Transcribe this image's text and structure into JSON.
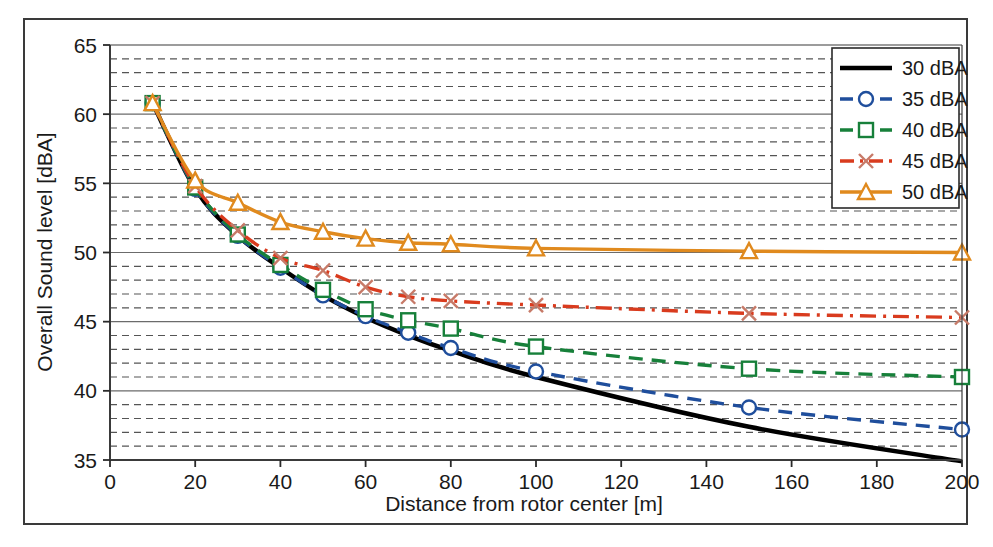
{
  "chart_data": {
    "type": "line",
    "title": "",
    "xlabel": "Distance from rotor center [m]",
    "ylabel": "Overall Sound level [dBA]",
    "xlim": [
      0,
      200
    ],
    "ylim": [
      35,
      65
    ],
    "xticks": [
      0,
      20,
      40,
      60,
      80,
      100,
      120,
      140,
      160,
      180,
      200
    ],
    "yticks": [
      35,
      40,
      45,
      50,
      55,
      60,
      65
    ],
    "grid": "major solid horizontal, minor dashed horizontal every 1 dBA",
    "legend_position": "top-right inside plot",
    "series": [
      {
        "name": "30 dBA",
        "color": "#000000",
        "style": "solid",
        "marker": "none",
        "x": [
          10,
          20,
          30,
          40,
          50,
          60,
          70,
          80,
          100,
          150,
          200
        ],
        "y": [
          60.8,
          54.6,
          51.2,
          48.9,
          46.9,
          45.3,
          44.0,
          42.9,
          41.0,
          37.4,
          34.9
        ]
      },
      {
        "name": "35 dBA",
        "color": "#1F4E9C",
        "style": "dashed",
        "marker": "circle",
        "x": [
          10,
          20,
          30,
          40,
          50,
          60,
          70,
          80,
          100,
          150,
          200
        ],
        "y": [
          60.8,
          54.6,
          51.2,
          48.9,
          46.9,
          45.4,
          44.2,
          43.1,
          41.4,
          38.8,
          37.2
        ]
      },
      {
        "name": "40 dBA",
        "color": "#17803A",
        "style": "dashed",
        "marker": "square",
        "x": [
          10,
          20,
          30,
          40,
          50,
          60,
          70,
          80,
          100,
          150,
          200
        ],
        "y": [
          60.8,
          54.7,
          51.3,
          49.1,
          47.3,
          45.9,
          45.1,
          44.5,
          43.2,
          41.6,
          41.0
        ]
      },
      {
        "name": "45 dBA",
        "color": "#D93B1E",
        "style": "dash-dot",
        "marker": "x",
        "x": [
          10,
          20,
          30,
          40,
          50,
          60,
          70,
          80,
          100,
          150,
          200
        ],
        "y": [
          60.8,
          54.8,
          51.6,
          49.6,
          48.7,
          47.5,
          46.8,
          46.5,
          46.2,
          45.6,
          45.3
        ]
      },
      {
        "name": "50 dBA",
        "color": "#E08A1E",
        "style": "solid",
        "marker": "triangle",
        "x": [
          10,
          20,
          30,
          40,
          50,
          60,
          70,
          80,
          100,
          150,
          200
        ],
        "y": [
          60.8,
          55.2,
          53.6,
          52.2,
          51.5,
          51.0,
          50.7,
          50.6,
          50.3,
          50.1,
          50.0
        ]
      }
    ]
  },
  "legend": {
    "items": [
      {
        "label": "30 dBA"
      },
      {
        "label": "35 dBA"
      },
      {
        "label": "40 dBA"
      },
      {
        "label": "45 dBA"
      },
      {
        "label": "50 dBA"
      }
    ]
  }
}
